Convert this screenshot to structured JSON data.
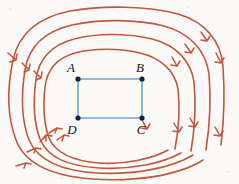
{
  "figure": {
    "background_color": "#fbfaf8",
    "width": 239,
    "height": 184
  },
  "field": {
    "name": "magnetic-field-lines",
    "color": "#c4563c",
    "direction": "counterclockwise",
    "line_count": 4,
    "arrow_count": 16,
    "description": "Four nested closed field-line contours surrounding the loop"
  },
  "circuit": {
    "name": "rectangular-loop",
    "color": "#6fa8d6",
    "vertices": [
      {
        "id": "A",
        "label": "A",
        "x": 78,
        "y": 79,
        "label_x": 72,
        "label_y": 72
      },
      {
        "id": "B",
        "label": "B",
        "x": 142,
        "y": 79,
        "label_x": 137,
        "label_y": 72
      },
      {
        "id": "C",
        "label": "C",
        "x": 142,
        "y": 118,
        "label_x": 138,
        "label_y": 133
      },
      {
        "id": "D",
        "label": "D",
        "x": 78,
        "y": 118,
        "label_x": 72,
        "label_y": 133
      }
    ],
    "edges": [
      {
        "name": "edge-AB",
        "from": "A",
        "to": "B"
      },
      {
        "name": "edge-BC",
        "from": "B",
        "to": "C"
      },
      {
        "name": "edge-CD",
        "from": "C",
        "to": "D"
      },
      {
        "name": "edge-DA",
        "from": "D",
        "to": "A"
      }
    ]
  },
  "labels": {
    "A": "A",
    "B": "B",
    "C": "C",
    "D": "D"
  }
}
